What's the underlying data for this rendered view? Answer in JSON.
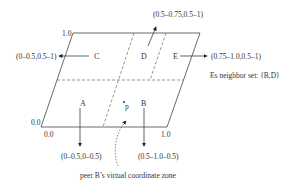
{
  "diagram": {
    "corner_labels": {
      "top_left": "1.0",
      "bottom_left_y": "0.0",
      "bottom_left_x": "0.0",
      "bottom_right": "1.0"
    },
    "zones": [
      {
        "id": "A",
        "label": "A",
        "range": "(0–0.5,0–0.5)"
      },
      {
        "id": "B",
        "label": "B",
        "range": "(0.5–1.0–0.5)"
      },
      {
        "id": "C",
        "label": "C",
        "range": "(0–0.5,0.5–1)"
      },
      {
        "id": "D",
        "label": "D",
        "range": "(0.5–0.75,0.5–1)"
      },
      {
        "id": "E",
        "label": "E",
        "range": "(0.75–1.0,0.5–1)"
      }
    ],
    "point_label": "p",
    "neighbor_note": "Es neighbor set: {B,D}",
    "caption": "peer B’s virtual coordinate zone"
  }
}
